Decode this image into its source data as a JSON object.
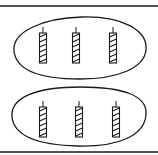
{
  "diagram": {
    "groups": [
      {
        "label": "group-1",
        "items": [
          "candle",
          "candle",
          "candle"
        ]
      },
      {
        "label": "group-2",
        "items": [
          "candle",
          "candle",
          "candle"
        ]
      }
    ],
    "group_count": 2,
    "items_per_group": 3,
    "colors": {
      "ink": "#1a1a1a",
      "background": "#ffffff"
    }
  }
}
